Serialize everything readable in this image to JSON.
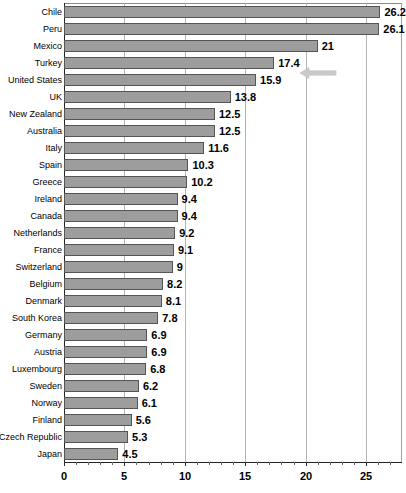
{
  "chart_data": {
    "type": "bar",
    "orientation": "horizontal",
    "title": "",
    "subtitle": "",
    "xlabel": "",
    "ylabel": "",
    "xlim": [
      0,
      27.9
    ],
    "ylim": null,
    "grid": true,
    "legend": null,
    "legend_position": "none",
    "xticks": [
      0,
      5,
      10,
      15,
      20,
      25
    ],
    "xtick_labels": [
      "0",
      "5",
      "10",
      "15",
      "20",
      "25"
    ],
    "categories": [
      "Chile",
      "Peru",
      "Mexico",
      "Turkey",
      "United States",
      "UK",
      "New Zealand",
      "Australia",
      "Italy",
      "Spain",
      "Greece",
      "Ireland",
      "Canada",
      "Netherlands",
      "France",
      "Switzerland",
      "Belgium",
      "Denmark",
      "South Korea",
      "Germany",
      "Austria",
      "Luxembourg",
      "Sweden",
      "Norway",
      "Finland",
      "Czech Republic",
      "Japan"
    ],
    "values": [
      26.2,
      26.1,
      21,
      17.4,
      15.9,
      13.8,
      12.5,
      12.5,
      11.6,
      10.3,
      10.2,
      9.4,
      9.4,
      9.2,
      9.1,
      9,
      8.2,
      8.1,
      7.8,
      6.9,
      6.9,
      6.8,
      6.2,
      6.1,
      5.6,
      5.3,
      4.5
    ],
    "value_labels": [
      "26.2",
      "26.1",
      "21",
      "17.4",
      "15.9",
      "13.8",
      "12.5",
      "12.5",
      "11.6",
      "10.3",
      "10.2",
      "9.4",
      "9.4",
      "9.2",
      "9.1",
      "9",
      "8.2",
      "8.1",
      "7.8",
      "6.9",
      "6.9",
      "6.8",
      "6.2",
      "6.1",
      "5.6",
      "5.3",
      "4.5"
    ],
    "bar_color": "#9d9d9d",
    "bar_edge_color": "#555555",
    "grid_color": "#b4b4b4",
    "axis_color": "#222222",
    "annotations": [
      {
        "name": "left-arrow-marker",
        "kind": "arrow-icon",
        "direction": "left",
        "color": "#c8c8c8",
        "points_at_category": "United States",
        "x_value": 20.0
      }
    ]
  }
}
